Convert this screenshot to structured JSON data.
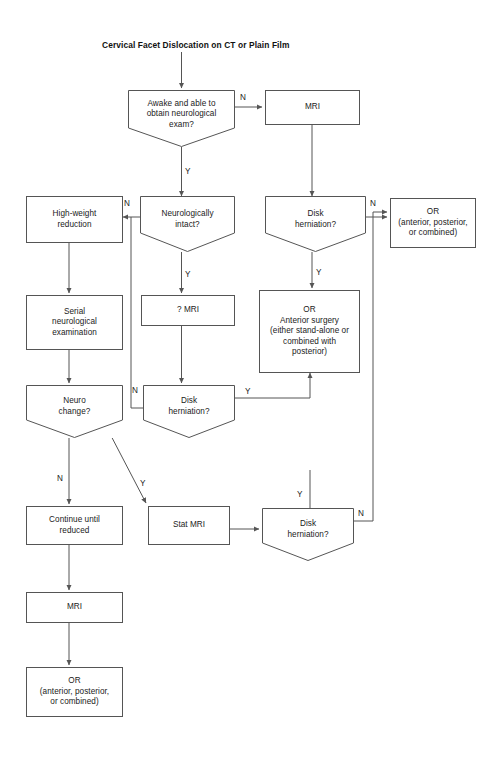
{
  "figure": {
    "title": "Cervical Facet Dislocation on CT or Plain Film",
    "type": "clinical-decision-flowchart",
    "line_color": "#555555",
    "text_color": "#1a1a1a",
    "background": "#ffffff"
  },
  "nodes": {
    "awake_decision": "Awake and able to\nobtain neurological\nexam?",
    "mri_top": "MRI",
    "neuro_intact_decision": "Neurologically\nintact?",
    "disk_herniation_top": "Disk\nherniation?",
    "or_right": "OR\n(anterior, posterior,\nor combined)",
    "high_weight_reduction": "High-weight\nreduction",
    "serial_neuro_exam": "Serial\nneurological\nexamination",
    "q_mri": "? MRI",
    "or_anterior_surgery": "OR\nAnterior surgery\n(either stand-alone or\ncombined with\nposterior)",
    "neuro_change_decision": "Neuro\nchange?",
    "disk_herniation_mid": "Disk\nherniation?",
    "continue_until_reduced": "Continue until\nreduced",
    "stat_mri": "Stat MRI",
    "disk_herniation_bottom": "Disk\nherniation?",
    "mri_bottom": "MRI",
    "or_bottom": "OR\n(anterior, posterior,\nor combined)"
  },
  "edge_labels": {
    "awake_no": "N",
    "awake_yes": "Y",
    "neuro_intact_no": "N",
    "neuro_intact_yes": "Y",
    "disk_top_no": "N",
    "disk_top_yes": "Y",
    "disk_mid_no": "N",
    "disk_mid_yes": "Y",
    "neuro_change_no": "N",
    "neuro_change_yes": "Y",
    "disk_bottom_yes": "Y",
    "disk_bottom_no": "N"
  }
}
